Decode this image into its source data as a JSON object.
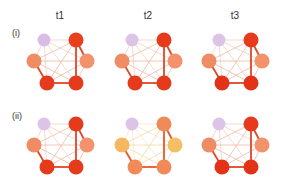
{
  "columns": [
    {
      "label": "t1",
      "x": 60
    },
    {
      "label": "t2",
      "x": 148
    },
    {
      "label": "t3",
      "x": 235
    }
  ],
  "rows": [
    {
      "label": "(i)",
      "y": 30
    },
    {
      "label": "(ii)",
      "y": 114
    }
  ],
  "colors": {
    "purple": "#d6b8e4",
    "salmon": "#f08a62",
    "red": "#e8381e",
    "darkred": "#de3418",
    "yellow": "#f4b860",
    "orange": "#f28a58"
  },
  "node_layout": [
    {
      "id": "n1",
      "dx": -16,
      "dy": 10,
      "r": 6.5
    },
    {
      "id": "n2",
      "dx": 16,
      "dy": 10,
      "r": 7.5
    },
    {
      "id": "n3",
      "dx": -26,
      "dy": 31,
      "r": 7.5
    },
    {
      "id": "n4",
      "dx": 27,
      "dy": 31,
      "r": 7.5
    },
    {
      "id": "n5",
      "dx": -13,
      "dy": 53,
      "r": 7.5
    },
    {
      "id": "n6",
      "dx": 16,
      "dy": 53,
      "r": 7.5
    }
  ],
  "graphs": [
    {
      "row": 0,
      "col": 0,
      "node_colors": [
        "#d9bde6",
        "#e8401f",
        "#f08c64",
        "#f3926b",
        "#e63a1c",
        "#e63a1c"
      ],
      "strong_edges": [
        [
          "n2",
          "n6"
        ],
        [
          "n5",
          "n6"
        ],
        [
          "n3",
          "n5"
        ],
        [
          "n2",
          "n4"
        ]
      ],
      "edge_color": "#e0482c",
      "weak_color": "#f3c0ad"
    },
    {
      "row": 0,
      "col": 1,
      "node_colors": [
        "#dcc3e8",
        "#e63a1c",
        "#f08c64",
        "#f3926b",
        "#e63a1c",
        "#e63a1c"
      ],
      "strong_edges": [
        [
          "n2",
          "n6"
        ],
        [
          "n5",
          "n6"
        ],
        [
          "n3",
          "n5"
        ],
        [
          "n2",
          "n4"
        ]
      ],
      "edge_color": "#e0482c",
      "weak_color": "#f3c0ad"
    },
    {
      "row": 0,
      "col": 2,
      "node_colors": [
        "#dcc3e8",
        "#e63a1c",
        "#f08c64",
        "#f3926b",
        "#e23318",
        "#e23318"
      ],
      "strong_edges": [
        [
          "n2",
          "n6"
        ],
        [
          "n5",
          "n6"
        ],
        [
          "n3",
          "n5"
        ],
        [
          "n2",
          "n4"
        ]
      ],
      "edge_color": "#e0482c",
      "weak_color": "#f3c0ad"
    },
    {
      "row": 1,
      "col": 0,
      "node_colors": [
        "#dcc3e8",
        "#e63a1c",
        "#f08c64",
        "#f3926b",
        "#e63a1c",
        "#e63a1c"
      ],
      "strong_edges": [
        [
          "n2",
          "n6"
        ],
        [
          "n5",
          "n6"
        ],
        [
          "n3",
          "n5"
        ],
        [
          "n2",
          "n4"
        ]
      ],
      "edge_color": "#e0482c",
      "weak_color": "#f3c0ad"
    },
    {
      "row": 1,
      "col": 1,
      "node_colors": [
        "#dcc3e8",
        "#f28a58",
        "#f4b860",
        "#f4be64",
        "#f28a58",
        "#f28a58"
      ],
      "strong_edges": [
        [
          "n2",
          "n6"
        ],
        [
          "n5",
          "n6"
        ],
        [
          "n3",
          "n5"
        ],
        [
          "n2",
          "n4"
        ]
      ],
      "edge_color": "#e8582c",
      "weak_color": "#f6dcb0"
    },
    {
      "row": 1,
      "col": 2,
      "node_colors": [
        "#dcc3e8",
        "#e63a1c",
        "#f08c64",
        "#f3926b",
        "#e23318",
        "#e23318"
      ],
      "strong_edges": [
        [
          "n2",
          "n6"
        ],
        [
          "n5",
          "n6"
        ],
        [
          "n3",
          "n5"
        ],
        [
          "n2",
          "n4"
        ]
      ],
      "edge_color": "#e0482c",
      "weak_color": "#f3c0ad"
    }
  ]
}
